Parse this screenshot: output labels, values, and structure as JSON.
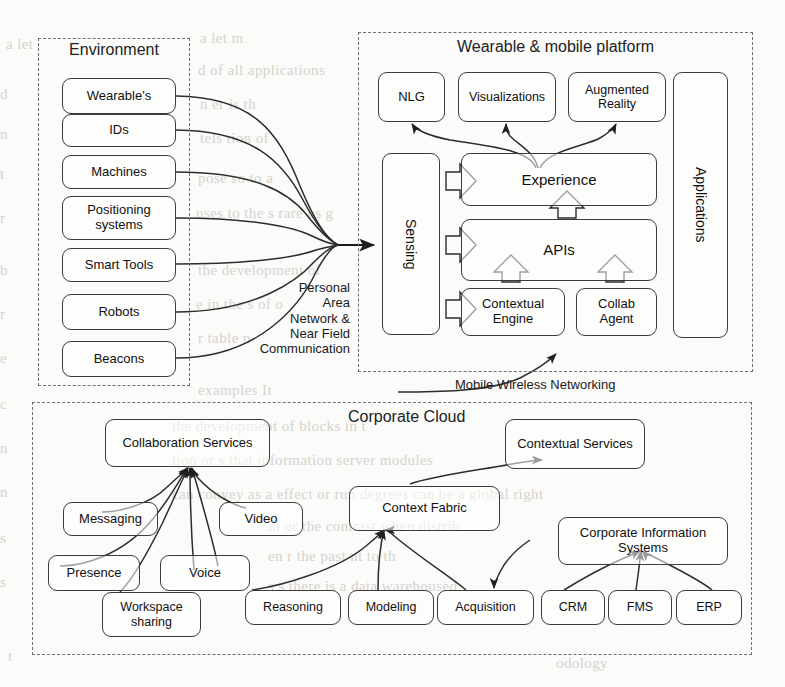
{
  "diagram": {
    "regions": [
      {
        "id": "environment",
        "label": "Environment"
      },
      {
        "id": "platform",
        "label": "Wearable & mobile platform"
      },
      {
        "id": "cloud",
        "label": "Corporate Cloud"
      }
    ],
    "environment": {
      "title": "Environment",
      "nodes": [
        {
          "id": "wearables",
          "label": "Wearable's"
        },
        {
          "id": "ids",
          "label": "IDs"
        },
        {
          "id": "machines",
          "label": "Machines"
        },
        {
          "id": "positioning-systems",
          "label": "Positioning systems"
        },
        {
          "id": "smart-tools",
          "label": "Smart Tools"
        },
        {
          "id": "robots",
          "label": "Robots"
        },
        {
          "id": "beacons",
          "label": "Beacons"
        }
      ]
    },
    "platform": {
      "title": "Wearable & mobile platform",
      "nodes": [
        {
          "id": "nlg",
          "label": "NLG"
        },
        {
          "id": "visualizations",
          "label": "Visualizations"
        },
        {
          "id": "augmented-reality",
          "label": "Augmented Reality"
        },
        {
          "id": "applications",
          "label": "Applications"
        },
        {
          "id": "sensing",
          "label": "Sensing"
        },
        {
          "id": "experience",
          "label": "Experience"
        },
        {
          "id": "apis",
          "label": "APIs"
        },
        {
          "id": "contextual-engine",
          "label": "Contextual Engine"
        },
        {
          "id": "collab-agent",
          "label": "Collab Agent"
        }
      ]
    },
    "cloud": {
      "title": "Corporate Cloud",
      "nodes": [
        {
          "id": "collaboration-services",
          "label": "Collaboration Services"
        },
        {
          "id": "messaging",
          "label": "Messaging"
        },
        {
          "id": "video",
          "label": "Video"
        },
        {
          "id": "presence",
          "label": "Presence"
        },
        {
          "id": "voice",
          "label": "Voice"
        },
        {
          "id": "workspace-sharing",
          "label": "Workspace sharing"
        },
        {
          "id": "contextual-services",
          "label": "Contextual Services"
        },
        {
          "id": "context-fabric",
          "label": "Context Fabric"
        },
        {
          "id": "corporate-information-systems",
          "label": "Corporate Information Systems"
        },
        {
          "id": "reasoning",
          "label": "Reasoning"
        },
        {
          "id": "modeling",
          "label": "Modeling"
        },
        {
          "id": "acquisition",
          "label": "Acquisition"
        },
        {
          "id": "crm",
          "label": "CRM"
        },
        {
          "id": "fms",
          "label": "FMS"
        },
        {
          "id": "erp",
          "label": "ERP"
        }
      ]
    },
    "connector_labels": [
      {
        "id": "pan-nfc",
        "label": "Personal\nArea\nNetwork &\nNear Field\nCommunication"
      },
      {
        "id": "mobile-wireless-networking",
        "label": "Mobile Wireless Networking"
      }
    ],
    "colors": {
      "node_border": "#3b3b3b",
      "region_border": "#6f6f6f",
      "wire": "#2d2d2d",
      "text": "#1a1a1a",
      "background": "#fbfbf9",
      "ghost_text": "#c9c6c0"
    },
    "ghost_text": [
      "a",
      "d",
      "n",
      "t",
      "r",
      "the development of",
      "that information server",
      "or devices can",
      "and sensors",
      "in the past",
      "there is a data warehouse"
    ]
  }
}
